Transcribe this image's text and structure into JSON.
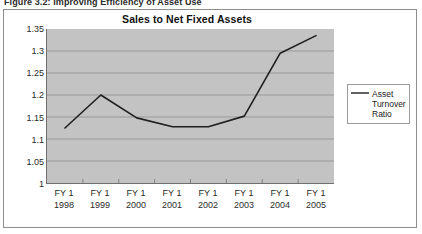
{
  "caption": "Figure 3.2: Improving Efficiency of Asset Use",
  "legend": {
    "label": "Asset Turnover Ratio",
    "swatch_icon": "line-swatch",
    "position": "right"
  },
  "colors": {
    "plot_background": "#c3c3c3",
    "page_background": "#ffffff",
    "line": "#1f1f1f",
    "gridline": "#8e8e8e",
    "axis": "#6f6f6f",
    "frame": "#8d8d8d"
  },
  "chart_data": {
    "type": "line",
    "title": "Sales to Net Fixed Assets",
    "xlabel": "",
    "ylabel": "",
    "categories": [
      "FY 1 1998",
      "FY 1 1999",
      "FY 1 2000",
      "FY 1 2001",
      "FY 1 2002",
      "FY 1 2003",
      "FY 1 2004",
      "FY 1 2005"
    ],
    "category_lines": [
      {
        "l1": "FY 1",
        "l2": "1998"
      },
      {
        "l1": "FY 1",
        "l2": "1999"
      },
      {
        "l1": "FY 1",
        "l2": "2000"
      },
      {
        "l1": "FY 1",
        "l2": "2001"
      },
      {
        "l1": "FY 1",
        "l2": "2002"
      },
      {
        "l1": "FY 1",
        "l2": "2003"
      },
      {
        "l1": "FY 1",
        "l2": "2004"
      },
      {
        "l1": "FY 1",
        "l2": "2005"
      }
    ],
    "series": [
      {
        "name": "Asset Turnover Ratio",
        "values": [
          1.125,
          1.2,
          1.148,
          1.128,
          1.128,
          1.152,
          1.295,
          1.335
        ]
      }
    ],
    "ylim": [
      1,
      1.35
    ],
    "ytick_step": 0.05,
    "yticks": [
      "1.35",
      "1.3",
      "1.25",
      "1.2",
      "1.15",
      "1.1",
      "1.05",
      "1"
    ],
    "ytick_values": [
      1.35,
      1.3,
      1.25,
      1.2,
      1.15,
      1.1,
      1.05,
      1
    ],
    "grid": true,
    "legend_position": "right",
    "markers": false
  }
}
